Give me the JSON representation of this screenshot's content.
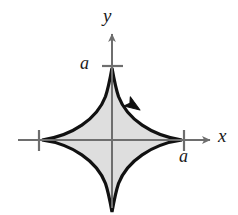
{
  "figure": {
    "background_color": "#ffffff",
    "curve": {
      "name": "astroid",
      "equation": "x^(2/3) + y^(2/3) = a^(2/3)",
      "stroke_color": "#111111",
      "fill_color": "#dedede",
      "stroke_width": 3.2,
      "cusps": [
        {
          "name": "right-cusp",
          "x": 182,
          "y": 140
        },
        {
          "name": "top-cusp",
          "x": 112,
          "y": 68
        },
        {
          "name": "left-cusp",
          "x": 42,
          "y": 140
        },
        {
          "name": "bottom-cusp",
          "x": 112,
          "y": 212
        }
      ],
      "orientation": "counterclockwise",
      "direction_arrow": {
        "name": "orientation-arrow",
        "x": 140,
        "y": 110,
        "angle_deg": 214,
        "color": "#111111"
      }
    },
    "axes": {
      "color": "#6e6e6e",
      "stroke_width": 2,
      "origin": {
        "x": 112,
        "y": 140
      },
      "x_axis": {
        "label": "x",
        "start_x": 18,
        "end_x": 212,
        "arrow": "right"
      },
      "y_axis": {
        "label": "y",
        "start_y": 206,
        "end_y": 32,
        "arrow": "up"
      }
    },
    "ticks": [
      {
        "name": "tick-y-positive-a",
        "label": "a",
        "axis": "y",
        "x": 112,
        "y": 68,
        "value": "a"
      },
      {
        "name": "tick-x-positive-a",
        "label": "a",
        "axis": "x",
        "x": 182,
        "y": 140,
        "value": "a"
      },
      {
        "name": "tick-x-negative-a",
        "label": "",
        "axis": "x",
        "x": 42,
        "y": 140,
        "value": "-a"
      }
    ],
    "labels": {
      "y_axis_label": "y",
      "x_axis_label": "x",
      "y_tick_label": "a",
      "x_tick_label": "a"
    }
  }
}
